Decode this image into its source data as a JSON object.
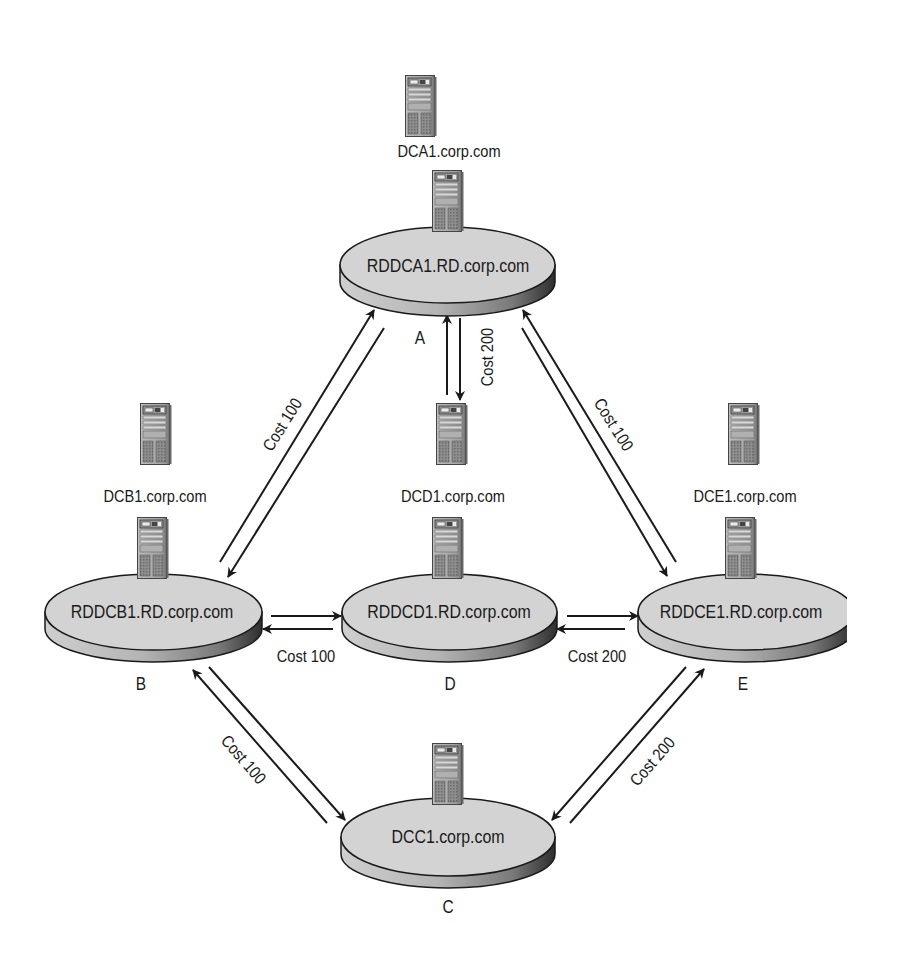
{
  "diagram": {
    "title": "",
    "colors": {
      "background": "#ffffff",
      "disc_top": "#d2d2d2",
      "disc_side_light": "#bdbdbd",
      "disc_side_dark": "#3a3a3a",
      "server_body": "#a8a8a8",
      "line": "#1a1a1a"
    },
    "sites": [
      {
        "id": "A",
        "letter": "A",
        "rodc": "RDDCA1.RD.corp.com",
        "dc": "DCA1.corp.com"
      },
      {
        "id": "B",
        "letter": "B",
        "rodc": "RDDCB1.RD.corp.com",
        "dc": "DCB1.corp.com"
      },
      {
        "id": "C",
        "letter": "C",
        "rodc": "DCC1.corp.com",
        "dc": ""
      },
      {
        "id": "D",
        "letter": "D",
        "rodc": "RDDCD1.RD.corp.com",
        "dc": "DCD1.corp.com"
      },
      {
        "id": "E",
        "letter": "E",
        "rodc": "RDDCE1.RD.corp.com",
        "dc": "DCE1.corp.com"
      }
    ],
    "links": [
      {
        "from": "B",
        "to": "A",
        "cost_label": "Cost 100"
      },
      {
        "from": "A",
        "to": "D",
        "cost_label": "Cost 200"
      },
      {
        "from": "A",
        "to": "E",
        "cost_label": "Cost 100"
      },
      {
        "from": "B",
        "to": "D",
        "cost_label": "Cost 100"
      },
      {
        "from": "D",
        "to": "E",
        "cost_label": "Cost 200"
      },
      {
        "from": "B",
        "to": "C",
        "cost_label": "Cost 100"
      },
      {
        "from": "E",
        "to": "C",
        "cost_label": "Cost 200"
      }
    ],
    "icons": {
      "server": "server-tower-icon",
      "site": "site-disc-icon",
      "link": "bidirectional-arrow-icon"
    }
  }
}
